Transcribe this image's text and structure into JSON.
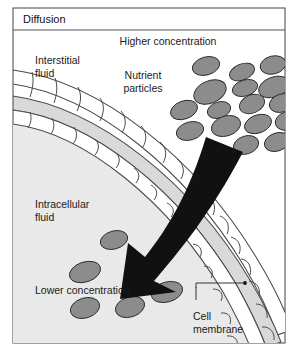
{
  "figure": {
    "title": "Diffusion",
    "border_color": "#555555",
    "background_color": "#ffffff"
  },
  "labels": {
    "higher_concentration": "Higher concentration",
    "interstitial_fluid_line1": "Interstitial",
    "interstitial_fluid_line2": "fluid",
    "nutrient_particles_line1": "Nutrient",
    "nutrient_particles_line2": "particles",
    "intracellular_fluid_line1": "Intracellular",
    "intracellular_fluid_line2": "fluid",
    "lower_concentration": "Lower concentration",
    "cell_membrane_line1": "Cell",
    "cell_membrane_line2": "membrane"
  },
  "colors": {
    "particle_fill": "#8c8c8c",
    "particle_stroke": "#2b2b2b",
    "membrane_band_fill": "#d9d9d9",
    "membrane_cell_fill": "#ffffff",
    "membrane_stroke": "#4a4a4a",
    "arrow_fill": "#111111",
    "text": "#1a1a1a",
    "leader_line": "#333333"
  },
  "diagram_data": {
    "type": "diagram",
    "subject": "Passive diffusion of nutrient particles across a cell membrane",
    "regions": [
      {
        "name": "interstitial-fluid",
        "position": "outside-membrane-upper-left",
        "concentration": "higher"
      },
      {
        "name": "cell-membrane",
        "position": "diagonal-arc-band",
        "structure": "two rows of cells flanking a gray band"
      },
      {
        "name": "intracellular-fluid",
        "position": "inside-membrane-lower-left",
        "concentration": "lower"
      }
    ],
    "particle_count_outside": 18,
    "particle_count_inside": 6,
    "flow_direction": "from higher concentration (outside) to lower concentration (inside)",
    "particles_outside": [
      {
        "cx": 206,
        "cy": 66,
        "rx": 14,
        "ry": 9,
        "rot": -16
      },
      {
        "cx": 242,
        "cy": 72,
        "rx": 13,
        "ry": 8,
        "rot": -22
      },
      {
        "cx": 273,
        "cy": 65,
        "rx": 13,
        "ry": 9,
        "rot": -14
      },
      {
        "cx": 210,
        "cy": 92,
        "rx": 17,
        "ry": 11,
        "rot": -24
      },
      {
        "cx": 245,
        "cy": 88,
        "rx": 13,
        "ry": 8,
        "rot": -17
      },
      {
        "cx": 274,
        "cy": 87,
        "rx": 16,
        "ry": 10,
        "rot": -20
      },
      {
        "cx": 184,
        "cy": 110,
        "rx": 14,
        "ry": 9,
        "rot": -20
      },
      {
        "cx": 219,
        "cy": 110,
        "rx": 12,
        "ry": 8,
        "rot": -18
      },
      {
        "cx": 252,
        "cy": 104,
        "rx": 13,
        "ry": 9,
        "rot": -22
      },
      {
        "cx": 282,
        "cy": 103,
        "rx": 13,
        "ry": 9,
        "rot": -18
      },
      {
        "cx": 190,
        "cy": 131,
        "rx": 14,
        "ry": 9,
        "rot": -16
      },
      {
        "cx": 226,
        "cy": 126,
        "rx": 15,
        "ry": 10,
        "rot": -18
      },
      {
        "cx": 258,
        "cy": 124,
        "rx": 14,
        "ry": 9,
        "rot": -20
      },
      {
        "cx": 287,
        "cy": 121,
        "rx": 12,
        "ry": 9,
        "rot": -17
      },
      {
        "cx": 246,
        "cy": 145,
        "rx": 13,
        "ry": 9,
        "rot": -18
      },
      {
        "cx": 277,
        "cy": 142,
        "rx": 13,
        "ry": 9,
        "rot": -20
      }
    ],
    "particles_inside": [
      {
        "cx": 114,
        "cy": 240,
        "rx": 14,
        "ry": 9,
        "rot": -16
      },
      {
        "cx": 85,
        "cy": 272,
        "rx": 16,
        "ry": 10,
        "rot": -18
      },
      {
        "cx": 167,
        "cy": 292,
        "rx": 16,
        "ry": 10,
        "rot": -16
      },
      {
        "cx": 85,
        "cy": 308,
        "rx": 15,
        "ry": 10,
        "rot": -17
      },
      {
        "cx": 130,
        "cy": 307,
        "rx": 15,
        "ry": 10,
        "rot": -18
      }
    ]
  }
}
